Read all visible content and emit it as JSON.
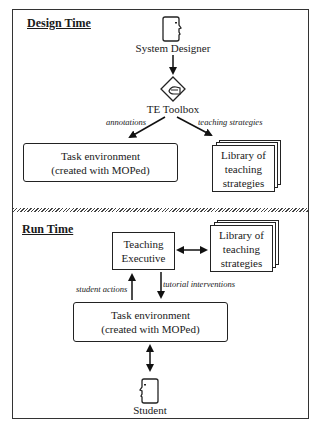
{
  "design_time": {
    "title": "Design Time",
    "designer": {
      "icon": "person-face-icon",
      "label": "System Designer"
    },
    "toolbox": {
      "icon": "pen-diamond-icon",
      "label": "TE Toolbox"
    },
    "edge_left_label": "annotations",
    "edge_right_label": "teaching strategies",
    "task_env": {
      "line1": "Task environment",
      "line2": "(created with MOPed)"
    },
    "library": {
      "line1": "Library of",
      "line2": "teaching",
      "line3": "strategies"
    }
  },
  "run_time": {
    "title": "Run Time",
    "executive": {
      "line1": "Teaching",
      "line2": "Executive"
    },
    "library": {
      "line1": "Library of",
      "line2": "teaching",
      "line3": "strategies"
    },
    "edge_up_label": "student actions",
    "edge_down_label": "tutorial interventions",
    "task_env": {
      "line1": "Task environment",
      "line2": "(created with MOPed)"
    },
    "student": {
      "icon": "person-face-icon",
      "label": "Student"
    }
  }
}
